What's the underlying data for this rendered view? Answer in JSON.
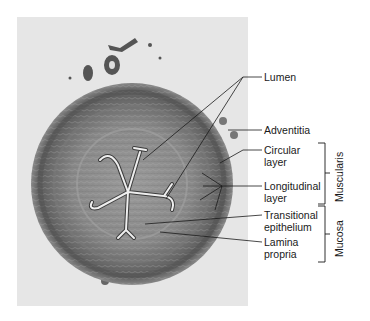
{
  "figure": {
    "type": "light micrograph, ureter cross-section",
    "colors": {
      "background": "#e6e6e6",
      "tissue_dark": "#5a5a5a",
      "tissue_mid": "#8e8e8e",
      "lumen": "#ededed",
      "line": "#1a1a1a"
    }
  },
  "labels": [
    {
      "id": "lumen",
      "text": "Lumen"
    },
    {
      "id": "adventitia",
      "text": "Adventitia"
    },
    {
      "id": "circular_layer",
      "text": "Circular\nlayer"
    },
    {
      "id": "longitudinal_layer",
      "text": "Longitudinal\nlayer"
    },
    {
      "id": "transitional_epithelium",
      "text": "Transitional\nepithelium"
    },
    {
      "id": "lamina_propria",
      "text": "Lamina\npropria"
    }
  ],
  "groups": [
    {
      "id": "muscularis",
      "text": "Muscularis"
    },
    {
      "id": "mucosa",
      "text": "Mucosa"
    }
  ]
}
